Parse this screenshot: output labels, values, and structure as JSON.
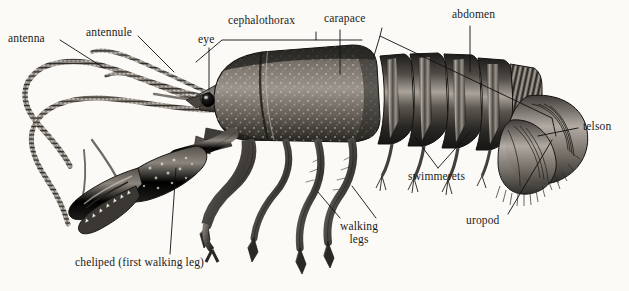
{
  "figure": {
    "style": "pen-and-ink / stipple scientific illustration, grayscale",
    "background_color": "#fbfaf7",
    "ink_color": "#1b1b1b",
    "width": 629,
    "height": 291
  },
  "labels": [
    {
      "id": "antenna",
      "text": "antenna",
      "x": 8,
      "y": 34,
      "align": "left",
      "leader": "diagonal-down-right"
    },
    {
      "id": "antennule",
      "text": "antennule",
      "x": 86,
      "y": 28,
      "align": "left",
      "leader": "diagonal-down-right"
    },
    {
      "id": "eye",
      "text": "eye",
      "x": 198,
      "y": 35,
      "align": "left",
      "leader": "vertical-down"
    },
    {
      "id": "cephalothorax",
      "text": "cephalothorax",
      "x": 228,
      "y": 16,
      "align": "left",
      "leader": "bracket-down"
    },
    {
      "id": "carapace",
      "text": "carapace",
      "x": 324,
      "y": 13,
      "align": "left",
      "leader": "vertical-down"
    },
    {
      "id": "abdomen",
      "text": "abdomen",
      "x": 452,
      "y": 9,
      "align": "left",
      "leader": "bracket-large"
    },
    {
      "id": "telson",
      "text": "telson",
      "x": 583,
      "y": 122,
      "align": "left",
      "leader": "diagonal-down-left"
    },
    {
      "id": "uropod",
      "text": "uropod",
      "x": 466,
      "y": 216,
      "align": "left",
      "leader": "diagonal-up-right"
    },
    {
      "id": "swimmerets",
      "text": "swimmerets",
      "x": 408,
      "y": 172,
      "align": "left",
      "leader": "two-leaders-up"
    },
    {
      "id": "walking-legs",
      "text": "walking\nlegs",
      "line1": "walking",
      "line2": "legs",
      "x": 342,
      "y": 222,
      "align": "left",
      "leader": "two-leaders-up"
    },
    {
      "id": "cheliped",
      "text": "cheliped (first walking leg)",
      "x": 75,
      "y": 258,
      "align": "left",
      "leader": "vertical-up"
    }
  ],
  "anatomy_parts": [
    "antenna",
    "antennule",
    "eye",
    "cephalothorax",
    "carapace",
    "abdomen",
    "telson",
    "uropod",
    "swimmerets",
    "walking legs",
    "cheliped (first walking leg)"
  ],
  "colors": {
    "ink": "#1b1b1b",
    "leader_line": "#101010",
    "shell_dark": "#2d2b28",
    "shell_mid": "#6b6560",
    "shell_light": "#b9b3ab",
    "paper": "#fbfaf7"
  }
}
